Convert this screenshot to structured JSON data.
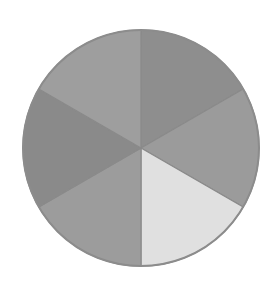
{
  "chart_data": {
    "type": "pie",
    "title": "",
    "categories": [
      "Slice 1",
      "Slice 2",
      "Slice 3",
      "Slice 4",
      "Slice 5",
      "Slice 6"
    ],
    "values": [
      1,
      1,
      1,
      1,
      1,
      1
    ],
    "colors": [
      "#8e8e8e",
      "#9b9b9b",
      "#e0e0e0",
      "#9c9c9c",
      "#8a8a8a",
      "#9e9e9e"
    ],
    "start_angle_deg": 0,
    "direction": "clockwise",
    "labels_visible": false,
    "legend": "none",
    "center": [
      141,
      148
    ],
    "radius": 118
  }
}
